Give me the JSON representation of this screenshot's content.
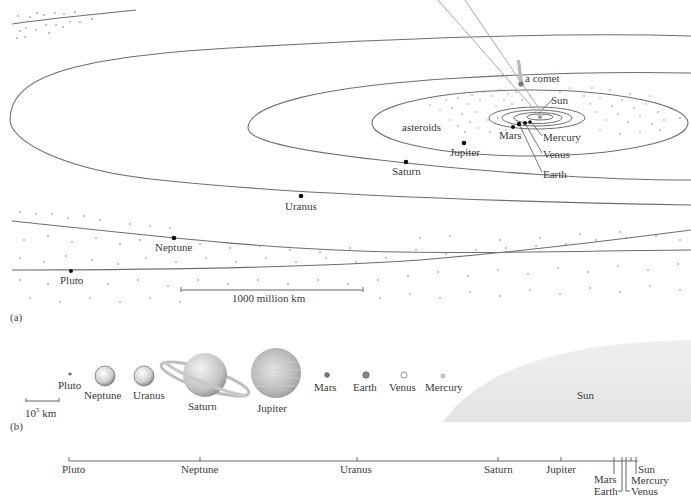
{
  "panels": {
    "a": {
      "tag": "(a)",
      "labels": {
        "comet": "a comet",
        "sun": "Sun",
        "asteroids": "asteroids",
        "mars": "Mars",
        "mercury": "Mercury",
        "venus": "Venus",
        "earth": "Earth",
        "jupiter": "Jupiter",
        "saturn": "Saturn",
        "uranus": "Uranus",
        "neptune": "Neptune",
        "pluto": "Pluto"
      },
      "scale_bar": "1000 million km"
    },
    "b": {
      "tag": "(b)",
      "scale_bar": "10",
      "scale_bar_exp": "5",
      "scale_bar_unit": " km",
      "bodies": [
        {
          "name": "Pluto"
        },
        {
          "name": "Neptune"
        },
        {
          "name": "Uranus"
        },
        {
          "name": "Saturn"
        },
        {
          "name": "Jupiter"
        },
        {
          "name": "Mars"
        },
        {
          "name": "Earth"
        },
        {
          "name": "Venus"
        },
        {
          "name": "Mercury"
        },
        {
          "name": "Sun"
        }
      ]
    },
    "c": {
      "tag": "(c)",
      "axis_labels": [
        "Pluto",
        "Neptune",
        "Uranus",
        "Saturn",
        "Jupiter",
        "Mars",
        "Earth",
        "Sun",
        "Mercury",
        "Venus"
      ]
    }
  },
  "colors": {
    "orbit_line": "#6e6e6e",
    "planet_fill": "#111111",
    "sun_disc": "#e9e9e9",
    "text": "#3a3a3a"
  }
}
